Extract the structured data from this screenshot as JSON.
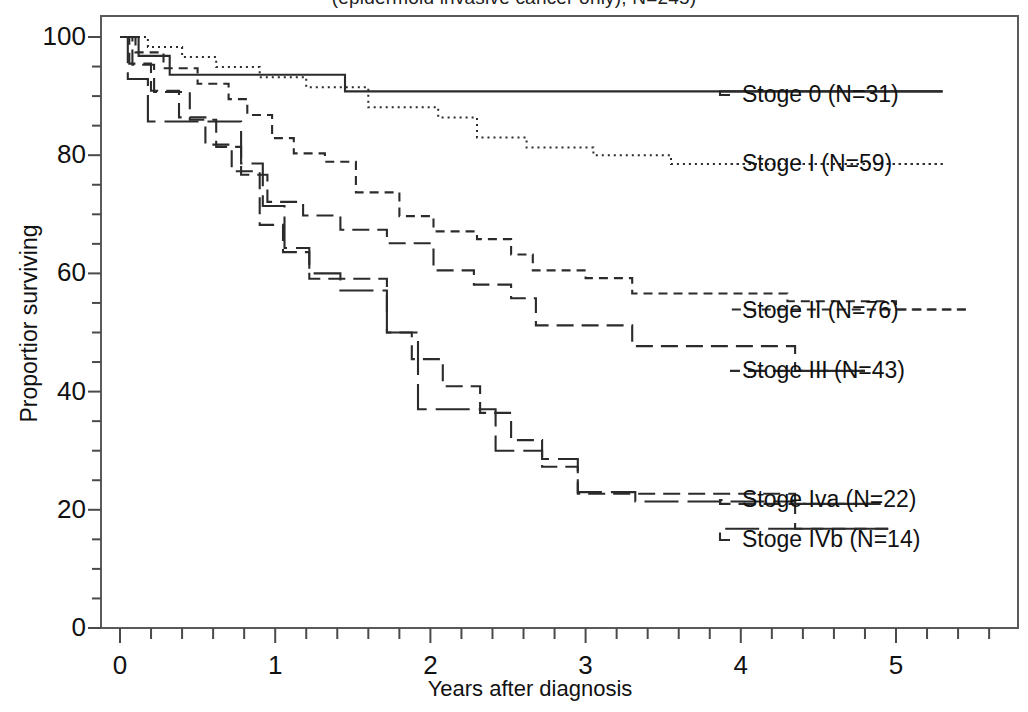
{
  "figure": {
    "title_partial": "(epidermoid invasive cancer only), N=245)",
    "title_note": "clipped at top edge of screenshot"
  },
  "axes": {
    "xlabel": "Years after diagnosis",
    "ylabel": "Proportior surviving",
    "xticks": [
      "0",
      "1",
      "2",
      "3",
      "4",
      "5"
    ],
    "yticks": [
      "0",
      "20",
      "40",
      "60",
      "80",
      "100"
    ]
  },
  "legend": [
    {
      "label": "Stoge 0 (N=31)",
      "y": 95
    },
    {
      "label": "Stoge I (N=59)",
      "y": 164
    },
    {
      "label": "Stoge II (N=76)",
      "y": 311
    },
    {
      "label": "Stoge III (N=43)",
      "y": 371
    },
    {
      "label": "Stoge Iva (N=22)",
      "y": 500
    },
    {
      "label": "Stoge IVb (N=14)",
      "y": 540
    }
  ],
  "chart_data": {
    "type": "line",
    "subtype": "kaplan-meier-step",
    "title": "(epidermoid invasive cancer only), N=245)",
    "xlabel": "Years after diagnosis",
    "ylabel": "Proportior surviving",
    "xlim": [
      0,
      5.8
    ],
    "ylim": [
      0,
      104
    ],
    "xticks": [
      0,
      1,
      2,
      3,
      4,
      5
    ],
    "yticks": [
      0,
      20,
      40,
      60,
      80,
      100
    ],
    "minor_tick_step_x": 0.2,
    "minor_tick_step_y": 5,
    "grid": false,
    "legend_position": "right-outside",
    "line_color": "#2b2b2b",
    "series": [
      {
        "name": "Stoge 0 (N=31)",
        "n": 31,
        "dash": "none",
        "label_y_px": 95,
        "points": [
          [
            0.0,
            100
          ],
          [
            0.12,
            100
          ],
          [
            0.12,
            96.8
          ],
          [
            0.32,
            96.8
          ],
          [
            0.32,
            93.6
          ],
          [
            0.86,
            93.6
          ],
          [
            0.86,
            93.6
          ],
          [
            1.45,
            93.6
          ],
          [
            1.45,
            90.8
          ],
          [
            5.3,
            90.8
          ]
        ]
      },
      {
        "name": "Stoge I (N=59)",
        "n": 59,
        "dash": "dotted",
        "label_y_px": 164,
        "points": [
          [
            0.0,
            100
          ],
          [
            0.18,
            100
          ],
          [
            0.18,
            98.3
          ],
          [
            0.4,
            98.3
          ],
          [
            0.4,
            96.6
          ],
          [
            0.62,
            96.6
          ],
          [
            0.62,
            94.9
          ],
          [
            0.9,
            94.9
          ],
          [
            0.9,
            93.2
          ],
          [
            1.2,
            93.2
          ],
          [
            1.2,
            91.5
          ],
          [
            1.6,
            91.5
          ],
          [
            1.6,
            88.1
          ],
          [
            2.05,
            88.1
          ],
          [
            2.05,
            86.4
          ],
          [
            2.3,
            86.4
          ],
          [
            2.3,
            83.0
          ],
          [
            2.62,
            83.0
          ],
          [
            2.62,
            81.3
          ],
          [
            3.05,
            81.3
          ],
          [
            3.05,
            80.0
          ],
          [
            3.55,
            80.0
          ],
          [
            3.55,
            78.5
          ],
          [
            5.3,
            78.5
          ]
        ]
      },
      {
        "name": "Stoge II (N=76)",
        "n": 76,
        "dash": "short-dash",
        "label_y_px": 311,
        "points": [
          [
            0.0,
            100
          ],
          [
            0.1,
            100
          ],
          [
            0.1,
            97.4
          ],
          [
            0.28,
            97.4
          ],
          [
            0.28,
            94.7
          ],
          [
            0.5,
            94.7
          ],
          [
            0.5,
            92.1
          ],
          [
            0.7,
            92.1
          ],
          [
            0.7,
            89.5
          ],
          [
            0.82,
            89.5
          ],
          [
            0.82,
            86.8
          ],
          [
            0.98,
            86.8
          ],
          [
            0.98,
            82.9
          ],
          [
            1.12,
            82.9
          ],
          [
            1.12,
            80.3
          ],
          [
            1.32,
            80.3
          ],
          [
            1.32,
            78.9
          ],
          [
            1.52,
            78.9
          ],
          [
            1.52,
            73.7
          ],
          [
            1.8,
            73.7
          ],
          [
            1.8,
            69.7
          ],
          [
            2.02,
            69.7
          ],
          [
            2.02,
            67.1
          ],
          [
            2.3,
            67.1
          ],
          [
            2.3,
            65.8
          ],
          [
            2.52,
            65.8
          ],
          [
            2.52,
            63.2
          ],
          [
            2.66,
            63.2
          ],
          [
            2.66,
            60.5
          ],
          [
            3.0,
            60.5
          ],
          [
            3.0,
            59.2
          ],
          [
            3.3,
            59.2
          ],
          [
            3.3,
            56.6
          ],
          [
            4.3,
            56.6
          ],
          [
            4.3,
            55.3
          ],
          [
            5.0,
            55.3
          ],
          [
            5.0,
            53.9
          ],
          [
            5.45,
            53.9
          ]
        ]
      },
      {
        "name": "Stoge III (N=43)",
        "n": 43,
        "dash": "long-dash",
        "label_y_px": 371,
        "points": [
          [
            0.0,
            100
          ],
          [
            0.08,
            100
          ],
          [
            0.08,
            95.3
          ],
          [
            0.22,
            95.3
          ],
          [
            0.22,
            90.7
          ],
          [
            0.45,
            90.7
          ],
          [
            0.45,
            86.0
          ],
          [
            0.62,
            86.0
          ],
          [
            0.62,
            81.4
          ],
          [
            0.78,
            81.4
          ],
          [
            0.78,
            76.7
          ],
          [
            0.95,
            76.7
          ],
          [
            0.95,
            72.1
          ],
          [
            1.18,
            72.1
          ],
          [
            1.18,
            69.8
          ],
          [
            1.42,
            69.8
          ],
          [
            1.42,
            67.4
          ],
          [
            1.72,
            67.4
          ],
          [
            1.72,
            65.1
          ],
          [
            2.02,
            65.1
          ],
          [
            2.02,
            60.5
          ],
          [
            2.28,
            60.5
          ],
          [
            2.28,
            58.1
          ],
          [
            2.52,
            58.1
          ],
          [
            2.52,
            55.8
          ],
          [
            2.68,
            55.8
          ],
          [
            2.68,
            51.2
          ],
          [
            3.3,
            51.2
          ],
          [
            3.3,
            47.7
          ],
          [
            4.35,
            47.7
          ],
          [
            4.35,
            43.5
          ],
          [
            4.8,
            43.5
          ]
        ]
      },
      {
        "name": "Stoge Iva (N=22)",
        "n": 22,
        "dash": "long-dash",
        "label_y_px": 500,
        "points": [
          [
            0.0,
            100
          ],
          [
            0.06,
            100
          ],
          [
            0.06,
            95.5
          ],
          [
            0.2,
            95.5
          ],
          [
            0.2,
            90.9
          ],
          [
            0.38,
            90.9
          ],
          [
            0.38,
            86.4
          ],
          [
            0.55,
            86.4
          ],
          [
            0.55,
            81.8
          ],
          [
            0.72,
            81.8
          ],
          [
            0.72,
            77.3
          ],
          [
            0.9,
            77.3
          ],
          [
            0.9,
            68.2
          ],
          [
            1.05,
            68.2
          ],
          [
            1.05,
            63.6
          ],
          [
            1.22,
            63.6
          ],
          [
            1.22,
            59.1
          ],
          [
            1.45,
            59.1
          ],
          [
            1.45,
            59.1
          ],
          [
            1.72,
            59.1
          ],
          [
            1.72,
            50.0
          ],
          [
            1.88,
            50.0
          ],
          [
            1.88,
            45.5
          ],
          [
            2.08,
            45.5
          ],
          [
            2.08,
            40.9
          ],
          [
            2.32,
            40.9
          ],
          [
            2.32,
            36.4
          ],
          [
            2.52,
            36.4
          ],
          [
            2.52,
            31.8
          ],
          [
            2.72,
            31.8
          ],
          [
            2.72,
            27.3
          ],
          [
            2.95,
            27.3
          ],
          [
            2.95,
            22.7
          ],
          [
            3.45,
            22.7
          ],
          [
            3.45,
            22.7
          ],
          [
            4.35,
            22.7
          ],
          [
            4.35,
            21.0
          ],
          [
            4.9,
            21.0
          ]
        ]
      },
      {
        "name": "Stoge IVb (N=14)",
        "n": 14,
        "dash": "solid-long",
        "label_y_px": 540,
        "points": [
          [
            0.0,
            100
          ],
          [
            0.05,
            100
          ],
          [
            0.05,
            92.9
          ],
          [
            0.18,
            92.9
          ],
          [
            0.18,
            85.7
          ],
          [
            0.48,
            85.7
          ],
          [
            0.48,
            85.7
          ],
          [
            0.78,
            85.7
          ],
          [
            0.78,
            78.6
          ],
          [
            0.92,
            78.6
          ],
          [
            0.92,
            71.4
          ],
          [
            1.06,
            71.4
          ],
          [
            1.06,
            64.3
          ],
          [
            1.22,
            64.3
          ],
          [
            1.22,
            60.0
          ],
          [
            1.42,
            60.0
          ],
          [
            1.42,
            57.1
          ],
          [
            1.72,
            57.1
          ],
          [
            1.72,
            50.0
          ],
          [
            1.92,
            50.0
          ],
          [
            1.92,
            37.0
          ],
          [
            2.28,
            37.0
          ],
          [
            2.28,
            37.0
          ],
          [
            2.42,
            37.0
          ],
          [
            2.42,
            30.0
          ],
          [
            2.72,
            30.0
          ],
          [
            2.72,
            28.6
          ],
          [
            2.95,
            28.6
          ],
          [
            2.95,
            23.0
          ],
          [
            3.32,
            23.0
          ],
          [
            3.32,
            21.4
          ],
          [
            4.35,
            21.4
          ],
          [
            4.35,
            16.8
          ],
          [
            4.95,
            16.8
          ]
        ]
      }
    ]
  },
  "plot_frame": {
    "left_px": 101,
    "right_px": 1018,
    "top_px": 16,
    "bottom_px": 628
  }
}
